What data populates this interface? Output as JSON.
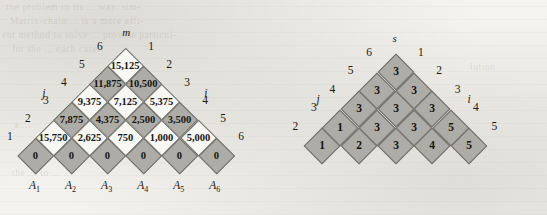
{
  "figure": {
    "caption_present": false,
    "colors": {
      "shaded_cell": "#adaca6",
      "plain_cell": "#f7f7f4",
      "cell_border": "#6f6d66",
      "text": "#17150f",
      "page_background": "#f2f1ee"
    }
  },
  "m_table": {
    "title": "m",
    "axis_left_label": "j",
    "axis_right_label": "i",
    "left_indices": [
      "6",
      "5",
      "4",
      "3",
      "2",
      "1"
    ],
    "right_indices": [
      "1",
      "2",
      "3",
      "4",
      "5",
      "6"
    ],
    "matrix_labels": [
      "A",
      "A",
      "A",
      "A",
      "A",
      "A"
    ],
    "matrix_subscripts": [
      "1",
      "2",
      "3",
      "4",
      "5",
      "6"
    ],
    "rows": [
      {
        "level": 6,
        "values": [
          "15,125"
        ]
      },
      {
        "level": 5,
        "values": [
          "11,875",
          "10,500"
        ]
      },
      {
        "level": 4,
        "values": [
          "9,375",
          "7,125",
          "5,375"
        ]
      },
      {
        "level": 3,
        "values": [
          "7,875",
          "4,375",
          "2,500",
          "3,500"
        ]
      },
      {
        "level": 2,
        "values": [
          "15,750",
          "2,625",
          "750",
          "1,000",
          "5,000"
        ]
      },
      {
        "level": 1,
        "values": [
          "0",
          "0",
          "0",
          "0",
          "0",
          "0"
        ]
      }
    ]
  },
  "s_table": {
    "title": "s",
    "axis_left_label": "j",
    "axis_right_label": "i",
    "left_indices": [
      "6",
      "5",
      "4",
      "3",
      "2"
    ],
    "right_indices": [
      "1",
      "2",
      "3",
      "4",
      "5"
    ],
    "rows": [
      {
        "level": 6,
        "values": [
          "3"
        ]
      },
      {
        "level": 5,
        "values": [
          "3",
          "3"
        ]
      },
      {
        "level": 4,
        "values": [
          "3",
          "3",
          "3"
        ]
      },
      {
        "level": 3,
        "values": [
          "1",
          "3",
          "3",
          "5"
        ]
      },
      {
        "level": 2,
        "values": [
          "1",
          "2",
          "3",
          "4",
          "5"
        ]
      }
    ]
  },
  "chart_data": {
    "type": "table",
    "tables": [
      {
        "name": "m",
        "description": "m[i,j] minimum scalar multiplication cost",
        "entries": [
          {
            "i": 1,
            "j": 1,
            "value": 0
          },
          {
            "i": 2,
            "j": 2,
            "value": 0
          },
          {
            "i": 3,
            "j": 3,
            "value": 0
          },
          {
            "i": 4,
            "j": 4,
            "value": 0
          },
          {
            "i": 5,
            "j": 5,
            "value": 0
          },
          {
            "i": 6,
            "j": 6,
            "value": 0
          },
          {
            "i": 1,
            "j": 2,
            "value": 15750
          },
          {
            "i": 2,
            "j": 3,
            "value": 2625
          },
          {
            "i": 3,
            "j": 4,
            "value": 750
          },
          {
            "i": 4,
            "j": 5,
            "value": 1000
          },
          {
            "i": 5,
            "j": 6,
            "value": 5000
          },
          {
            "i": 1,
            "j": 3,
            "value": 7875
          },
          {
            "i": 2,
            "j": 4,
            "value": 4375
          },
          {
            "i": 3,
            "j": 5,
            "value": 2500
          },
          {
            "i": 4,
            "j": 6,
            "value": 3500
          },
          {
            "i": 1,
            "j": 4,
            "value": 9375
          },
          {
            "i": 2,
            "j": 5,
            "value": 7125
          },
          {
            "i": 3,
            "j": 6,
            "value": 5375
          },
          {
            "i": 1,
            "j": 5,
            "value": 11875
          },
          {
            "i": 2,
            "j": 6,
            "value": 10500
          },
          {
            "i": 1,
            "j": 6,
            "value": 15125
          }
        ]
      },
      {
        "name": "s",
        "description": "s[i,j] optimal split point k",
        "entries": [
          {
            "i": 1,
            "j": 2,
            "value": 1
          },
          {
            "i": 2,
            "j": 3,
            "value": 2
          },
          {
            "i": 3,
            "j": 4,
            "value": 3
          },
          {
            "i": 4,
            "j": 5,
            "value": 4
          },
          {
            "i": 5,
            "j": 6,
            "value": 5
          },
          {
            "i": 1,
            "j": 3,
            "value": 1
          },
          {
            "i": 2,
            "j": 4,
            "value": 3
          },
          {
            "i": 3,
            "j": 5,
            "value": 3
          },
          {
            "i": 4,
            "j": 6,
            "value": 5
          },
          {
            "i": 1,
            "j": 4,
            "value": 3
          },
          {
            "i": 2,
            "j": 5,
            "value": 3
          },
          {
            "i": 3,
            "j": 6,
            "value": 3
          },
          {
            "i": 1,
            "j": 5,
            "value": 3
          },
          {
            "i": 2,
            "j": 6,
            "value": 3
          },
          {
            "i": 1,
            "j": 6,
            "value": 3
          }
        ]
      }
    ]
  },
  "background_text": [
    "the problem in its ... way. sim-",
    "  Matrix-chain ... is a more effi-",
    "ent method to solve ... provide particul-",
    "  for the ... each case.",
    "lution",
    "  a ...",
    "  the ... to ..."
  ]
}
